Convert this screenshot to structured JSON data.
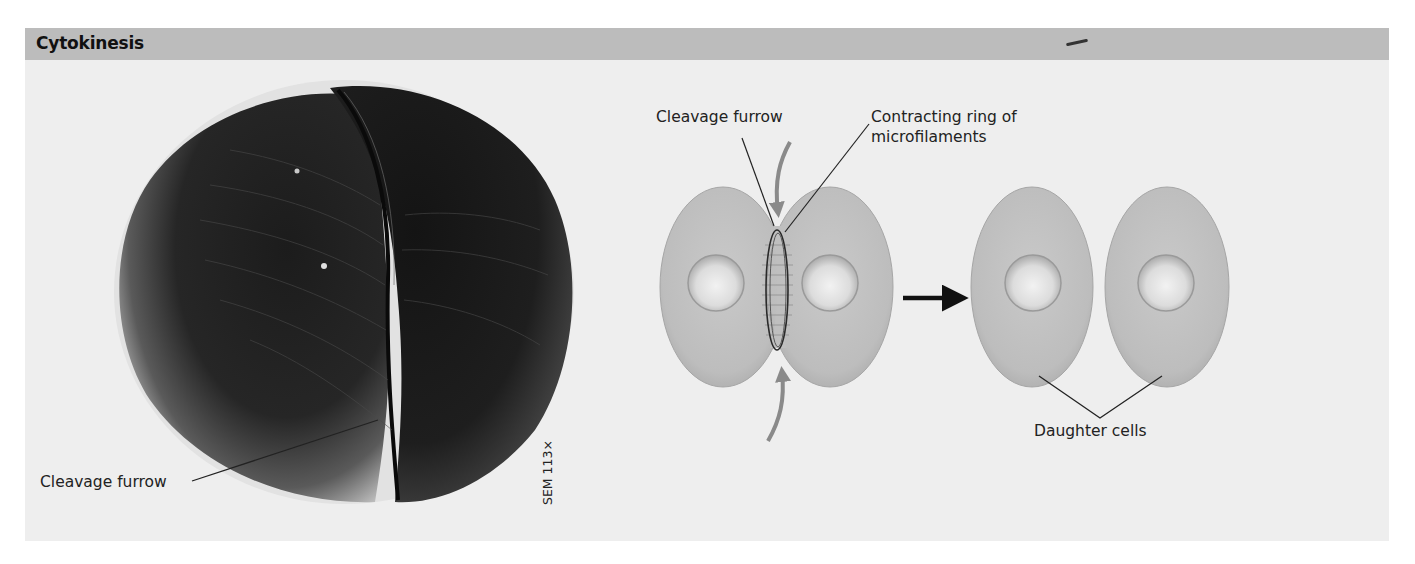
{
  "panel": {
    "title": "Cytokinesis",
    "header_color": "#bcbcbc",
    "body_color": "#eeeeee"
  },
  "micrograph": {
    "label_cleavage_furrow": "Cleavage furrow",
    "magnification": "SEM 113×"
  },
  "diagram": {
    "label_cleavage_furrow": "Cleavage furrow",
    "label_ring_line1": "Contracting ring of",
    "label_ring_line2": "microfilaments",
    "label_daughter_cells": "Daughter cells",
    "cell_color": "#bdbdbd",
    "arrow_color": "#111111",
    "curved_arrow_color": "#8a8a8a"
  }
}
